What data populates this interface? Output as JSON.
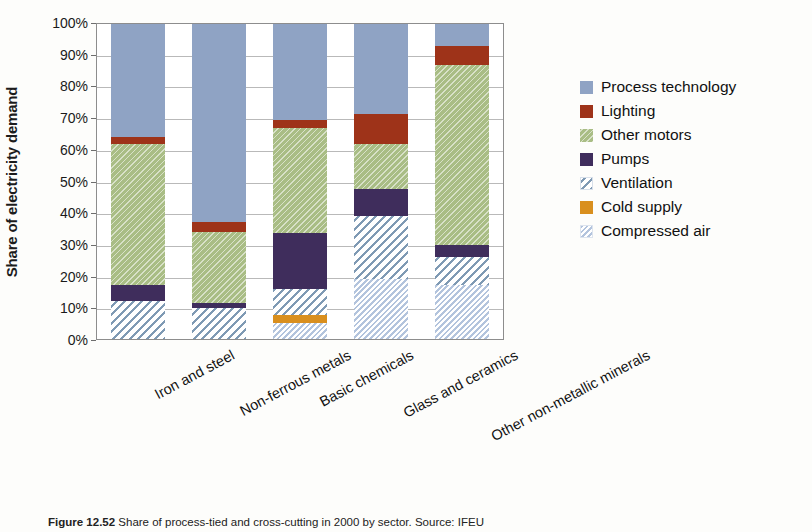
{
  "chart_data": {
    "type": "bar",
    "subtype": "stacked-bar-100pct",
    "title": "",
    "xlabel": "",
    "ylabel": "Share of electricity demand",
    "ylim": [
      0,
      100
    ],
    "ytick_labels": [
      "0%",
      "10%",
      "20%",
      "30%",
      "40%",
      "50%",
      "60%",
      "70%",
      "80%",
      "90%",
      "100%"
    ],
    "ytick_values": [
      0,
      10,
      20,
      30,
      40,
      50,
      60,
      70,
      80,
      90,
      100
    ],
    "grid": true,
    "legend_position": "right",
    "categories": [
      "Iron and steel",
      "Non-ferrous metals",
      "Basic chemicals",
      "Glass and ceramics",
      "Other non-metallic minerals"
    ],
    "series": [
      {
        "name": "Compressed air",
        "color": "#c5d2e6",
        "pattern": "diagonal-hatch",
        "values": [
          0,
          0,
          5,
          19,
          17
        ]
      },
      {
        "name": "Cold supply",
        "color": "#d98f1e",
        "pattern": "solid",
        "values": [
          0,
          0,
          2.5,
          0,
          0
        ]
      },
      {
        "name": "Ventilation",
        "color": "#7f9ab4",
        "pattern": "diagonal-lines",
        "values": [
          12,
          10,
          8.5,
          20,
          9
        ]
      },
      {
        "name": "Pumps",
        "color": "#3f2d5c",
        "pattern": "solid",
        "values": [
          5,
          1.5,
          17.5,
          8.5,
          4
        ]
      },
      {
        "name": "Other motors",
        "color": "#a9bd85",
        "pattern": "diagonal-hatch",
        "values": [
          45,
          22.5,
          33.5,
          14.5,
          57
        ]
      },
      {
        "name": "Lighting",
        "color": "#9e3319",
        "pattern": "solid",
        "values": [
          2,
          3,
          2.5,
          9.5,
          6
        ]
      },
      {
        "name": "Process technology",
        "color": "#8fa3c4",
        "pattern": "solid",
        "values": [
          36,
          63,
          30.5,
          28.5,
          7
        ]
      }
    ]
  },
  "legend": {
    "items": [
      {
        "label": "Process technology",
        "fill_class": "f-process",
        "icon": "legend-swatch-process-technology"
      },
      {
        "label": "Lighting",
        "fill_class": "f-lighting",
        "icon": "legend-swatch-lighting"
      },
      {
        "label": "Other motors",
        "fill_class": "f-motors",
        "icon": "legend-swatch-other-motors"
      },
      {
        "label": "Pumps",
        "fill_class": "f-pumps",
        "icon": "legend-swatch-pumps"
      },
      {
        "label": "Ventilation",
        "fill_class": "f-ventilation",
        "icon": "legend-swatch-ventilation"
      },
      {
        "label": "Cold supply",
        "fill_class": "f-cold",
        "icon": "legend-swatch-cold-supply"
      },
      {
        "label": "Compressed air",
        "fill_class": "f-compressed",
        "icon": "legend-swatch-compressed-air"
      }
    ]
  },
  "caption": {
    "figure_number": "Figure 12.52",
    "text": "Share of process-tied and cross-cutting in 2000 by sector. Source: IFEU"
  }
}
